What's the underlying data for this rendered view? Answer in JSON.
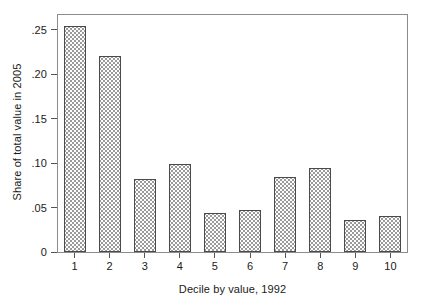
{
  "chart_data": {
    "type": "bar",
    "title": "",
    "subtitle": "",
    "xlabel": "Decile by value, 1992",
    "ylabel": "Share of total value in 2005",
    "categories": [
      "1",
      "2",
      "3",
      "4",
      "5",
      "6",
      "7",
      "8",
      "9",
      "10"
    ],
    "values": [
      0.254,
      0.22,
      0.082,
      0.099,
      0.044,
      0.047,
      0.084,
      0.094,
      0.036,
      0.04
    ],
    "series": [
      {
        "name": "Share of total value in 2005",
        "values": [
          0.254,
          0.22,
          0.082,
          0.099,
          0.044,
          0.047,
          0.084,
          0.094,
          0.036,
          0.04
        ]
      }
    ],
    "ylim": [
      0,
      0.2675
    ],
    "xlim": [
      0.5,
      10.5
    ],
    "yticks": [
      0,
      0.05,
      0.1,
      0.15,
      0.2,
      0.25
    ],
    "ytick_labels": [
      "0",
      ".05",
      ".10",
      ".15",
      ".20",
      ".25"
    ],
    "xtick_labels": [
      "1",
      "2",
      "3",
      "4",
      "5",
      "6",
      "7",
      "8",
      "9",
      "10"
    ],
    "grid": false,
    "legend": false,
    "legend_position": "none",
    "bar_fill_pattern": "dotted-crosshatch",
    "bar_edge_color": "#4a4a4a",
    "bar_fill_color": "#fdfdfd",
    "frame_color": "#8c8c8c",
    "text_color": "#1a1a1a",
    "background_color": "#ffffff"
  },
  "axes": {
    "y_title": "Share of total value in 2005",
    "x_title": "Decile by value, 1992",
    "y_ticks": [
      {
        "label": ".25",
        "value": 0.25
      },
      {
        "label": ".20",
        "value": 0.2
      },
      {
        "label": ".15",
        "value": 0.15
      },
      {
        "label": ".10",
        "value": 0.1
      },
      {
        "label": ".05",
        "value": 0.05
      },
      {
        "label": "0",
        "value": 0
      }
    ],
    "x_ticks": [
      {
        "label": "1",
        "value": 1
      },
      {
        "label": "2",
        "value": 2
      },
      {
        "label": "3",
        "value": 3
      },
      {
        "label": "4",
        "value": 4
      },
      {
        "label": "5",
        "value": 5
      },
      {
        "label": "6",
        "value": 6
      },
      {
        "label": "7",
        "value": 7
      },
      {
        "label": "8",
        "value": 8
      },
      {
        "label": "9",
        "value": 9
      },
      {
        "label": "10",
        "value": 10
      }
    ]
  }
}
